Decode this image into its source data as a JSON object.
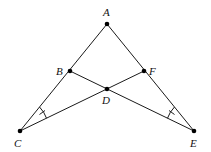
{
  "diagram": {
    "points": {
      "A": {
        "label": "A",
        "x": 107,
        "y": 24
      },
      "B": {
        "label": "B",
        "x": 70,
        "y": 71
      },
      "F": {
        "label": "F",
        "x": 144,
        "y": 71
      },
      "D": {
        "label": "D",
        "x": 107,
        "y": 89
      },
      "C": {
        "label": "C",
        "x": 20,
        "y": 131
      },
      "E": {
        "label": "E",
        "x": 194,
        "y": 131
      }
    },
    "segments": [
      "AC",
      "AE",
      "BE",
      "FC"
    ],
    "angle_marks": [
      "angle ACF",
      "angle AEB"
    ],
    "colors": {
      "stroke": "#1a1a1a",
      "point": "#000000",
      "background": "#ffffff"
    }
  }
}
